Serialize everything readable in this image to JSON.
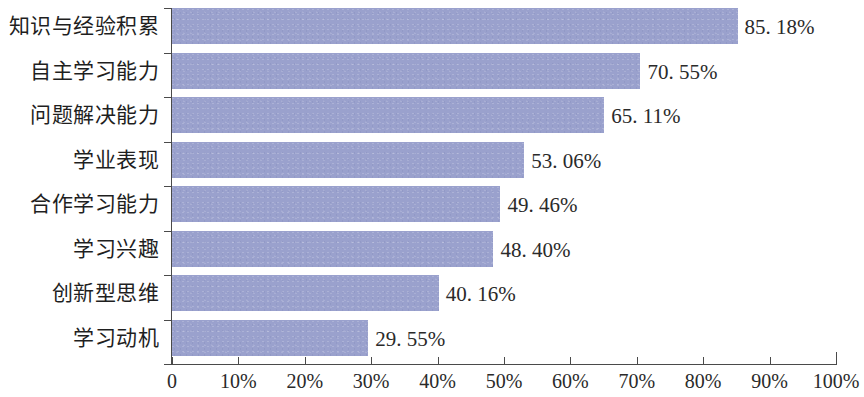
{
  "chart_data": {
    "type": "bar",
    "orientation": "horizontal",
    "title": "",
    "subtitle": "",
    "xlabel": "",
    "ylabel": "",
    "xlim": [
      0,
      100
    ],
    "grid": false,
    "legend": null,
    "legend_position": "none",
    "bar_color": "#9aa1cd",
    "axis_color": "#4a4a4a",
    "background_color": "#ffffff",
    "categories": [
      "知识与经验积累",
      "自主学习能力",
      "问题解决能力",
      "学业表现",
      "合作学习能力",
      "学习兴趣",
      "创新型思维",
      "学习动机"
    ],
    "values": [
      85.18,
      70.55,
      65.11,
      53.06,
      49.46,
      48.4,
      40.16,
      29.55
    ],
    "value_labels": [
      "85. 18%",
      "70. 55%",
      "65. 11%",
      "53. 06%",
      "49. 46%",
      "48. 40%",
      "40. 16%",
      "29. 55%"
    ],
    "xticks": [
      0,
      10,
      20,
      30,
      40,
      50,
      60,
      70,
      80,
      90,
      100
    ],
    "xtick_labels": [
      "0",
      "10%",
      "20%",
      "30%",
      "40%",
      "50%",
      "60%",
      "70%",
      "80%",
      "90%",
      "100%"
    ]
  }
}
